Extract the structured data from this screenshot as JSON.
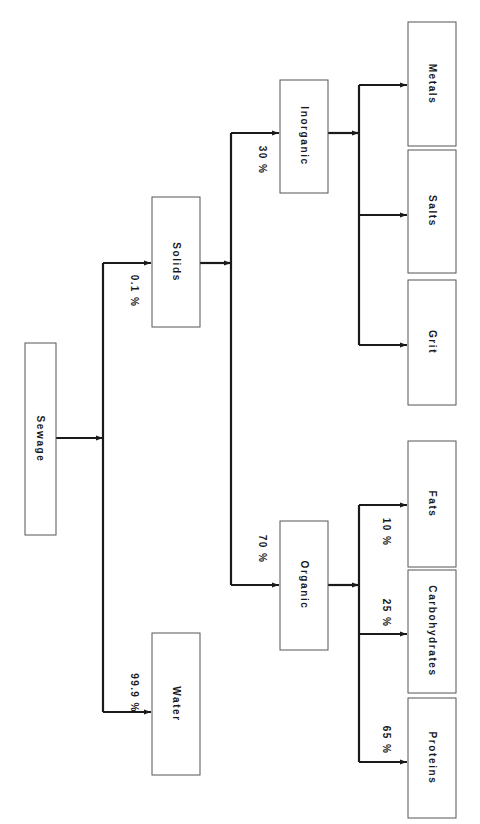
{
  "diagram": {
    "type": "tree",
    "orientation": "rotated-90-clockwise",
    "root": "Sewage",
    "nodes": {
      "sewage": {
        "label": "Sewage"
      },
      "water": {
        "label": "Water",
        "percent": "99.9 %"
      },
      "solids": {
        "label": "Solids",
        "percent": "0.1 %"
      },
      "organic": {
        "label": "Organic",
        "percent": "70 %"
      },
      "inorganic": {
        "label": "Inorganic",
        "percent": "30 %"
      },
      "proteins": {
        "label": "Proteins",
        "percent": "65 %"
      },
      "carbohydrates": {
        "label": "Carbohydrates",
        "percent": "25 %"
      },
      "fats": {
        "label": "Fats",
        "percent": "10 %"
      },
      "grit": {
        "label": "Grit"
      },
      "salts": {
        "label": "Salts"
      },
      "metals": {
        "label": "Metals"
      }
    },
    "edges": [
      {
        "from": "Sewage",
        "to": "Water",
        "label": "99.9 %"
      },
      {
        "from": "Sewage",
        "to": "Solids",
        "label": "0.1 %"
      },
      {
        "from": "Solids",
        "to": "Organic",
        "label": "70 %"
      },
      {
        "from": "Solids",
        "to": "Inorganic",
        "label": "30 %"
      },
      {
        "from": "Organic",
        "to": "Proteins",
        "label": "65 %"
      },
      {
        "from": "Organic",
        "to": "Carbohydrates",
        "label": "25 %"
      },
      {
        "from": "Organic",
        "to": "Fats",
        "label": "10 %"
      },
      {
        "from": "Inorganic",
        "to": "Grit",
        "label": ""
      },
      {
        "from": "Inorganic",
        "to": "Salts",
        "label": ""
      },
      {
        "from": "Inorganic",
        "to": "Metals",
        "label": ""
      }
    ]
  },
  "colors": {
    "line": "#1a1a1a",
    "box_border": "#555555",
    "background": "#ffffff"
  }
}
